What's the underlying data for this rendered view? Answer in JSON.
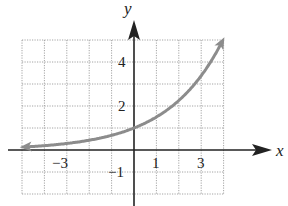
{
  "chart_data": {
    "type": "line",
    "title": "",
    "xlabel": "x",
    "ylabel": "y",
    "xlim": [
      -5,
      4
    ],
    "ylim": [
      -2,
      5
    ],
    "grid": true,
    "x_tick_labels": [
      "-3",
      "1",
      "3"
    ],
    "y_tick_labels": [
      "4",
      "2",
      "-1"
    ],
    "series": [
      {
        "name": "exponential curve",
        "color": "#8c8c8c",
        "function": "y = 1.5^x",
        "x": [
          -5,
          -4,
          -3,
          -2,
          -1,
          0,
          1,
          2,
          3,
          4
        ],
        "y": [
          0.13,
          0.2,
          0.3,
          0.44,
          0.67,
          1,
          1.5,
          2.25,
          3.38,
          5.06
        ],
        "arrows": "both ends"
      }
    ]
  },
  "labels": {
    "x_axis": "x",
    "y_axis": "y",
    "xt_m3": "−3",
    "xt_1": "1",
    "xt_3": "3",
    "yt_4": "4",
    "yt_2": "2",
    "yt_m1": "−1"
  }
}
